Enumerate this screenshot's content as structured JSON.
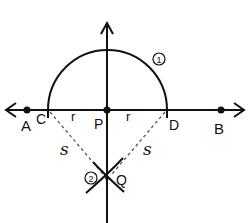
{
  "diagram": {
    "colors": {
      "ink": "#111111",
      "background": "#ffffff",
      "dashed": "#555555"
    },
    "points": {
      "A": {
        "label": "A"
      },
      "B": {
        "label": "B"
      },
      "C": {
        "label": "C"
      },
      "D": {
        "label": "D"
      },
      "P": {
        "label": "P"
      },
      "Q": {
        "label": "Q"
      }
    },
    "radius_labels": {
      "r_left": "r",
      "r_right": "r",
      "s_left": "s",
      "s_right": "s"
    },
    "step_markers": {
      "step1": "1",
      "step2": "2"
    }
  }
}
